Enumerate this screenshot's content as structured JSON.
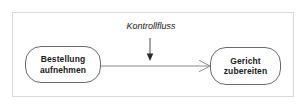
{
  "diagram": {
    "type": "activity-diagram",
    "title": "",
    "frame": {
      "border_color": "#d9d9d9",
      "background": "#ffffff"
    },
    "nodes": [
      {
        "id": "bestellung",
        "shape": "rounded-rectangle",
        "line1": "Bestellung",
        "line2": "aufnehmen",
        "border_color": "#6b6b6b",
        "fill": "#ffffff",
        "text_color": "#1a1a1a"
      },
      {
        "id": "gericht",
        "shape": "rounded-rectangle",
        "line1": "Gericht",
        "line2": "zubereiten",
        "border_color": "#6b6b6b",
        "fill": "#ffffff",
        "text_color": "#1a1a1a"
      }
    ],
    "edges": [
      {
        "id": "kontrollfluss-edge",
        "from": "bestellung",
        "to": "gericht",
        "style": "solid",
        "arrowhead": "open",
        "color": "#6b6b6b"
      }
    ],
    "annotations": [
      {
        "id": "kontrollfluss",
        "text": "Kontrollfluss",
        "style": "italic",
        "pointer": "down-arrow",
        "target": "kontrollfluss-edge",
        "color": "#1a1a1a"
      }
    ]
  }
}
